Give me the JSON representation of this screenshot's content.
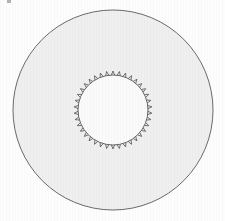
{
  "figure": {
    "title": "Concentric annulus with toothed inner ring",
    "canvas": {
      "width": 225,
      "height": 221,
      "background_color": "#fdfdfd"
    },
    "outer_disk": {
      "label": "outer-disk",
      "cx": 113,
      "cy": 110,
      "r": 100,
      "fill_color": "#efefef",
      "stroke_color": "#5a5a5a",
      "stroke_width": 0.9
    },
    "inner_disk": {
      "label": "inner-disk",
      "cx": 113,
      "cy": 110,
      "r": 35,
      "fill_color": "#fafafa",
      "stroke_color": "#555555",
      "stroke_width": 0.9
    },
    "inner_ring_ticks": {
      "label": "inner-ring-tick-marks",
      "count": 38,
      "direction": "outward",
      "length": 4,
      "half_width_deg": 2.6,
      "stroke_color": "#4f4f4f",
      "stroke_width": 0.8
    },
    "artifact": {
      "label": "corner-speck",
      "x": 7,
      "y": 0,
      "color": "#9a9a9a"
    }
  },
  "chart_data": {
    "type": "scatter",
    "title": "",
    "xlabel": "",
    "ylabel": "",
    "xlim": [
      13,
      213
    ],
    "ylim": [
      10,
      210
    ],
    "grid": false,
    "legend": "none",
    "annotations": [],
    "series": [
      {
        "name": "outer-boundary-circle",
        "shape": "circle",
        "center": [
          113,
          110
        ],
        "radius": 100,
        "values": []
      },
      {
        "name": "inner-boundary-circle",
        "shape": "circle",
        "center": [
          113,
          110
        ],
        "radius": 35,
        "values": []
      },
      {
        "name": "inner-tick-spikes",
        "shape": "radial-ticks",
        "center": [
          113,
          110
        ],
        "radius": 35,
        "tick_count": 38,
        "tick_length": 4,
        "values": []
      }
    ]
  }
}
